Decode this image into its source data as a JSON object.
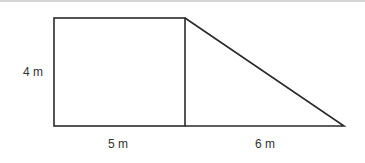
{
  "figure": {
    "type": "composite-shape",
    "labels": {
      "height": "4 m",
      "rect_width": "5 m",
      "triangle_base": "6 m"
    },
    "colors": {
      "stroke": "#2b2b2b",
      "text": "#333333",
      "top_rule": "#d4d4d4"
    }
  }
}
